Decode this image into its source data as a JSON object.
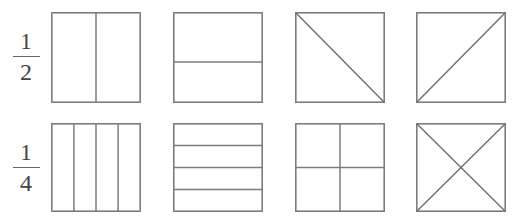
{
  "worksheet": {
    "title": "Fraction squares worksheet",
    "background_color": "#ffffff",
    "line_color": "#7d7d7d",
    "text_color": "#434343"
  },
  "rows": [
    {
      "label": {
        "numerator": "1",
        "denominator": "2",
        "text": "1/2",
        "name": "one-half"
      },
      "figures": [
        {
          "name": "square-vertical-halves",
          "description": "square divided by one vertical line into 2 equal parts",
          "parts": 2,
          "division": "vertical"
        },
        {
          "name": "square-horizontal-halves",
          "description": "square divided by one horizontal line into 2 equal parts",
          "parts": 2,
          "division": "horizontal"
        },
        {
          "name": "square-diagonal-halves-tl-br",
          "description": "square divided by a diagonal from top-left to bottom-right into 2 equal parts",
          "parts": 2,
          "division": "diagonal-tl-br"
        },
        {
          "name": "square-diagonal-halves-bl-tr",
          "description": "square divided by a diagonal from bottom-left to top-right into 2 equal parts",
          "parts": 2,
          "division": "diagonal-bl-tr"
        }
      ]
    },
    {
      "label": {
        "numerator": "1",
        "denominator": "4",
        "text": "1/4",
        "name": "one-quarter"
      },
      "figures": [
        {
          "name": "square-vertical-quarters",
          "description": "square divided by three vertical lines into 4 equal strips",
          "parts": 4,
          "division": "vertical-thirds-lines"
        },
        {
          "name": "square-horizontal-quarters",
          "description": "square divided by three horizontal lines into 4 equal strips",
          "parts": 4,
          "division": "horizontal-thirds-lines"
        },
        {
          "name": "square-cross-quarters",
          "description": "square divided by one vertical and one horizontal line into 4 equal quadrants",
          "parts": 4,
          "division": "cross"
        },
        {
          "name": "square-diagonal-quarters",
          "description": "square divided by both diagonals forming an X into 4 equal triangles",
          "parts": 4,
          "division": "both-diagonals"
        }
      ]
    }
  ]
}
